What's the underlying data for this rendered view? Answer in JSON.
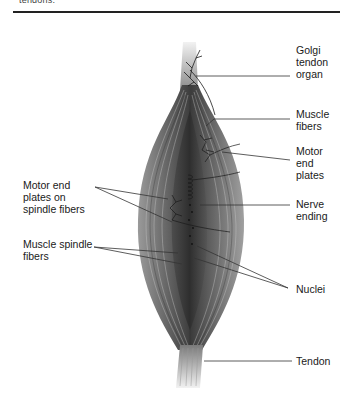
{
  "header": {
    "clipped_text": "tendons."
  },
  "figure": {
    "labels": {
      "golgi": "Golgi\ntendon\norgan",
      "muscle_fibers": "Muscle\nfibers",
      "motor_end_plates": "Motor\nend\nplates",
      "motor_end_plates_spindle": "Motor end\nplates on\nspindle fibers",
      "nerve_ending": "Nerve\nending",
      "muscle_spindle_fibers": "Muscle spindle\nfibers",
      "nuclei": "Nuclei",
      "tendon": "Tendon"
    },
    "colors": {
      "muscle_dark": "#3a3a3a",
      "muscle_mid": "#7a7a7a",
      "muscle_light": "#b5b5b5",
      "tendon": "#e2e2e2",
      "leader_line": "#333333"
    }
  }
}
